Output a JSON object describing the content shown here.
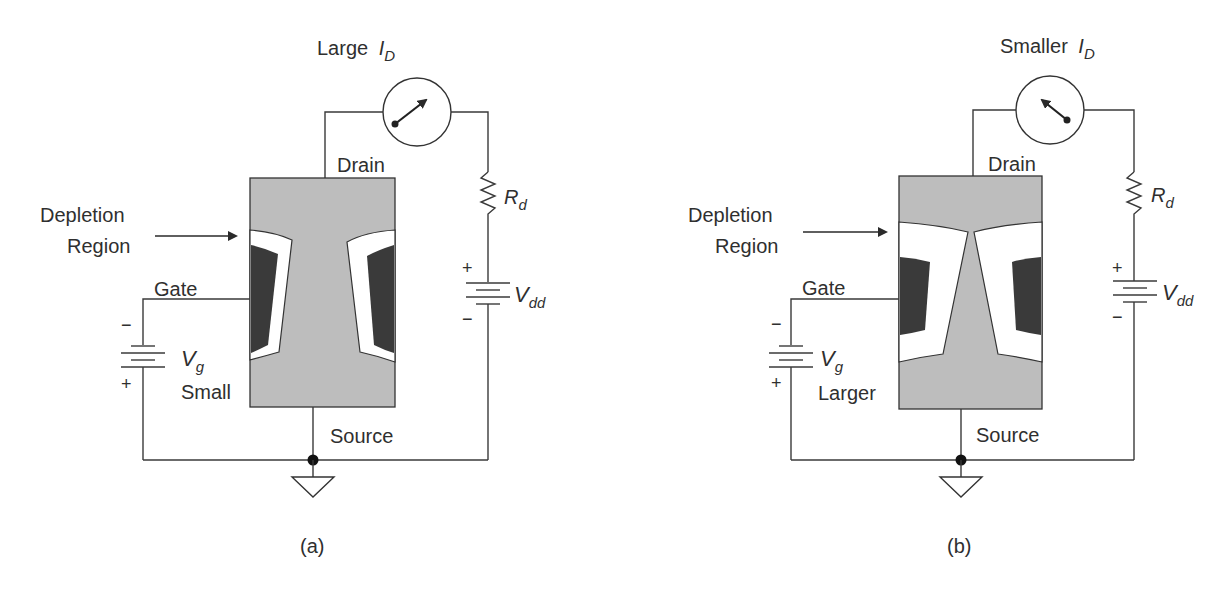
{
  "figure": {
    "panels": [
      {
        "id": "a",
        "caption": "(a)",
        "meter_label": "Large",
        "meter_symbol": "I",
        "meter_subscript": "D",
        "meter_needle": "pointing-up-right",
        "drain_label": "Drain",
        "source_label": "Source",
        "gate_label": "Gate",
        "depletion_label_line1": "Depletion",
        "depletion_label_line2": "Region",
        "resistor_symbol": "R",
        "resistor_subscript": "d",
        "vdd_symbol": "V",
        "vdd_subscript": "dd",
        "vdd_plus": "+",
        "vdd_minus": "−",
        "vg_symbol": "V",
        "vg_subscript": "g",
        "vg_state": "Small",
        "vg_plus": "+",
        "vg_minus": "−",
        "depletion_width": "narrow"
      },
      {
        "id": "b",
        "caption": "(b)",
        "meter_label": "Smaller",
        "meter_symbol": "I",
        "meter_subscript": "D",
        "meter_needle": "pointing-up-left",
        "drain_label": "Drain",
        "source_label": "Source",
        "gate_label": "Gate",
        "depletion_label_line1": "Depletion",
        "depletion_label_line2": "Region",
        "resistor_symbol": "R",
        "resistor_subscript": "d",
        "vdd_symbol": "V",
        "vdd_subscript": "dd",
        "vdd_plus": "+",
        "vdd_minus": "−",
        "vg_symbol": "V",
        "vg_subscript": "g",
        "vg_state": "Larger",
        "vg_plus": "+",
        "vg_minus": "−",
        "depletion_width": "wide"
      }
    ],
    "colors": {
      "channel": "#bdbdbd",
      "gate": "#3a3a3a",
      "depletion": "#ffffff",
      "wire": "#3a3a3a"
    }
  }
}
